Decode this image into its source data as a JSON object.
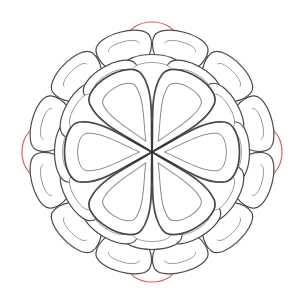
{
  "image": {
    "description": "Line-art mandala / flower drawing with layered teardrop petals in gray outline and a few red outer arcs",
    "colors": {
      "background": "#ffffff",
      "outline": "#4a4a4a",
      "inner_outline": "#8a8a8a",
      "accent": "#e06060"
    },
    "center": {
      "x": 152,
      "y": 152
    },
    "inner_petal_count": 6,
    "ring_count": 3
  }
}
